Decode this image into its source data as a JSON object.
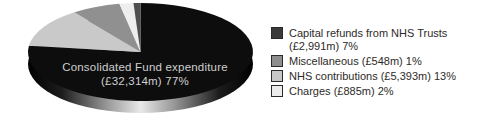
{
  "chart_data": {
    "type": "pie",
    "title": "",
    "units": "£m",
    "pie_label": {
      "line1": "Consolidated Fund expenditure",
      "line2": "(£32,314m) 77%"
    },
    "slices": [
      {
        "label": "Consolidated Fund expenditure",
        "amount_gbp_m": 32314,
        "pct": 77,
        "color": "#0d0d0d"
      },
      {
        "label": "NHS contributions",
        "amount_gbp_m": 5393,
        "pct": 13,
        "color": "#c9c9c9"
      },
      {
        "label": "Capital refunds from NHS Trusts",
        "amount_gbp_m": 2991,
        "pct": 7,
        "color": "#909090"
      },
      {
        "label": "Charges",
        "amount_gbp_m": 885,
        "pct": 2,
        "color": "#eeeeee"
      },
      {
        "label": "Miscellaneous",
        "amount_gbp_m": 548,
        "pct": 1,
        "color": "#4f4f4f"
      }
    ],
    "start_angle_deg": 90,
    "direction": "clockwise",
    "legend_position": "right",
    "legend": [
      {
        "text": "Capital refunds from NHS Trusts",
        "text2": "(£2,991m) 7%",
        "color": "#3a3a3a"
      },
      {
        "text": "Miscellaneous (£548m) 1%",
        "color": "#8e8e8e"
      },
      {
        "text": "NHS contributions (£5,393m) 13%",
        "color": "#c6c6c6"
      },
      {
        "text": "Charges (£885m) 2%",
        "color": "#ececec"
      }
    ],
    "rim_gradient": [
      {
        "offset": "0%",
        "color": "#000000"
      },
      {
        "offset": "15%",
        "color": "#1c1c1c"
      },
      {
        "offset": "35%",
        "color": "#979797"
      },
      {
        "offset": "50%",
        "color": "#e9e9e9"
      },
      {
        "offset": "65%",
        "color": "#979797"
      },
      {
        "offset": "85%",
        "color": "#1c1c1c"
      },
      {
        "offset": "100%",
        "color": "#000000"
      }
    ],
    "geometry": {
      "cx": 140.5,
      "cy": 52,
      "rx": 112.5,
      "ry": 49,
      "depth": 12
    }
  }
}
